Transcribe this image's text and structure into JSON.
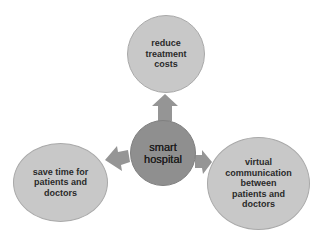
{
  "diagram": {
    "center": {
      "label": "smart\nhospital"
    },
    "nodes": [
      {
        "id": "top",
        "label": "reduce\ntreatment\ncosts"
      },
      {
        "id": "left",
        "label": "save time for\npatients and\ndoctors"
      },
      {
        "id": "right",
        "label": "virtual\ncommunication\nbetween\npatients and\ndoctors"
      }
    ],
    "colors": {
      "outer_fill": "#c8c8c8",
      "center_fill": "#8f8f8f",
      "arrow_fill": "#959595",
      "text": "#2a2a2a"
    }
  }
}
